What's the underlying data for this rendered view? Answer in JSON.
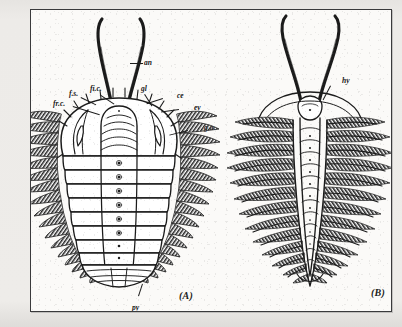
{
  "plate": {
    "figures": [
      {
        "id": "A",
        "caption": "(A)",
        "view": "dorsal",
        "labels": [
          {
            "key": "an",
            "text": "an",
            "meaning": "antenna"
          },
          {
            "key": "fs",
            "text": "f.s.",
            "meaning": "facial suture"
          },
          {
            "key": "fic",
            "text": "fi.c.",
            "meaning": "fixed cheek"
          },
          {
            "key": "frc",
            "text": "fr.c.",
            "meaning": "free cheek"
          },
          {
            "key": "gl",
            "text": "gl",
            "meaning": "glabella"
          },
          {
            "key": "ce",
            "text": "ce",
            "meaning": "cephalon"
          },
          {
            "key": "ey",
            "text": "ey",
            "meaning": "eye"
          },
          {
            "key": "ga",
            "text": "g.a.",
            "meaning": "genal angle"
          },
          {
            "key": "py",
            "text": "py",
            "meaning": "pygidium"
          }
        ]
      },
      {
        "id": "B",
        "caption": "(B)",
        "view": "ventral",
        "labels": [
          {
            "key": "hy",
            "text": "hy",
            "meaning": "hypostome"
          }
        ]
      }
    ],
    "colors": {
      "ink": "#1b1b1b",
      "frame": "#3a3a3c",
      "plate_background": "#fbfaf8",
      "page_background": "#e9e9e6"
    }
  }
}
